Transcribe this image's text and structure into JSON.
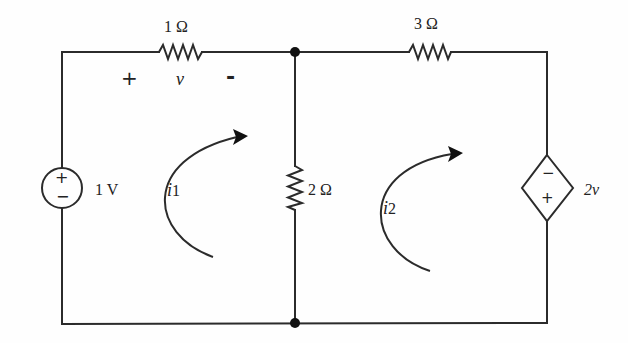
{
  "diagram": {
    "type": "circuit-schematic",
    "components": {
      "r1": {
        "label": "1 Ω",
        "value_ohms": 1
      },
      "r2": {
        "label": "2 Ω",
        "value_ohms": 2
      },
      "r3": {
        "label": "3 Ω",
        "value_ohms": 3
      },
      "vs": {
        "label": "1 V",
        "plus": "+",
        "minus": "−"
      },
      "dep": {
        "label": "2v",
        "plus": "+",
        "minus": "−"
      }
    },
    "voltage_v": {
      "plus": "+",
      "symbol": "v",
      "minus": "-"
    },
    "mesh_currents": [
      {
        "symbol": "i",
        "sub": "1"
      },
      {
        "symbol": "i",
        "sub": "2"
      }
    ]
  }
}
